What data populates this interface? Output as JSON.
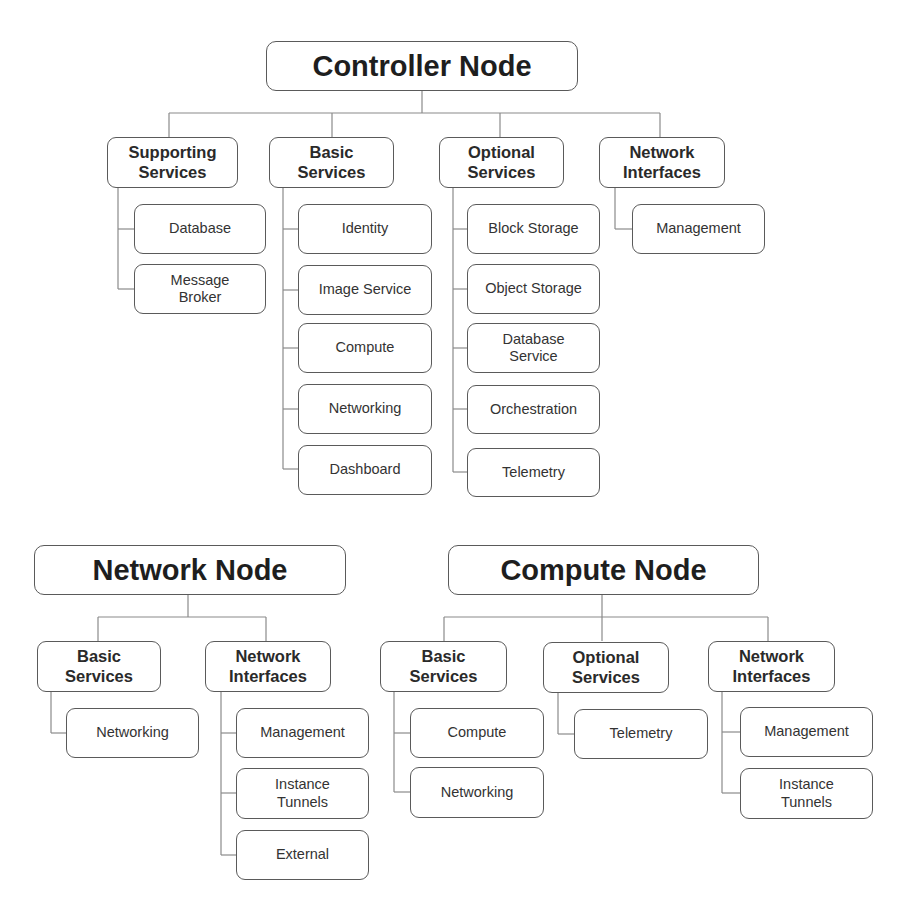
{
  "diagram": {
    "colors": {
      "border": "#5a5a5a",
      "connector": "#8a8a8a",
      "text": "#2b2b2b",
      "background": "#ffffff"
    },
    "controller": {
      "title": "Controller Node",
      "groups": [
        {
          "label": "Supporting Services",
          "items": [
            "Database",
            "Message Broker"
          ]
        },
        {
          "label": "Basic Services",
          "items": [
            "Identity",
            "Image Service",
            "Compute",
            "Networking",
            "Dashboard"
          ]
        },
        {
          "label": "Optional Services",
          "items": [
            "Block Storage",
            "Object Storage",
            "Database Service",
            "Orchestration",
            "Telemetry"
          ]
        },
        {
          "label": "Network Interfaces",
          "items": [
            "Management"
          ]
        }
      ]
    },
    "network": {
      "title": "Network Node",
      "groups": [
        {
          "label": "Basic Services",
          "items": [
            "Networking"
          ]
        },
        {
          "label": "Network Interfaces",
          "items": [
            "Management",
            "Instance Tunnels",
            "External"
          ]
        }
      ]
    },
    "compute": {
      "title": "Compute Node",
      "groups": [
        {
          "label": "Basic Services",
          "items": [
            "Compute",
            "Networking"
          ]
        },
        {
          "label": "Optional Services",
          "items": [
            "Telemetry"
          ]
        },
        {
          "label": "Network Interfaces",
          "items": [
            "Management",
            "Instance Tunnels"
          ]
        }
      ]
    }
  }
}
